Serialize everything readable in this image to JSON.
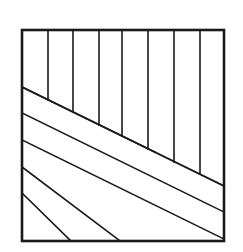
{
  "figure": {
    "title": "Herringbone chevron line pattern in square frame",
    "background_color": "#ffffff",
    "stroke_color": "#1a1a1a",
    "canvas": {
      "width": 243,
      "height": 252
    },
    "frame": {
      "name": "outer-square-border",
      "x": 22,
      "y": 30,
      "width": 202,
      "height": 211,
      "stroke_width": 2.6,
      "fill": "none"
    },
    "main_diagonal": {
      "name": "chevron-spine",
      "x1": 22,
      "y1": 87,
      "x2": 224,
      "y2": 186,
      "stroke_width": 1.8
    },
    "vertical_lines": {
      "count": 7,
      "stroke_width": 1.6,
      "top_y": 30,
      "x_positions": [
        48,
        73,
        99,
        122,
        148,
        174,
        200
      ],
      "bottom_y_on_spine": [
        100,
        112,
        125,
        136,
        149,
        162,
        174
      ]
    },
    "diagonal_lines": {
      "count": 5,
      "stroke_width": 1.6,
      "slope": 0.49,
      "left_edge_x": 22,
      "left_edge_y_starts": [
        87,
        113,
        140,
        167,
        193
      ],
      "end_points": [
        {
          "x": 155,
          "y": 152
        },
        {
          "x": 224,
          "y": 212
        },
        {
          "x": 224,
          "y": 239
        },
        {
          "x": 120,
          "y": 241
        },
        {
          "x": 71,
          "y": 241
        }
      ],
      "bottom_edge_y": 241,
      "bottom_edge_x_ends": [
        33,
        80,
        125
      ]
    },
    "labels": {
      "region_upper": "vertical-hatch-region",
      "region_lower": "diagonal-hatch-region"
    }
  }
}
